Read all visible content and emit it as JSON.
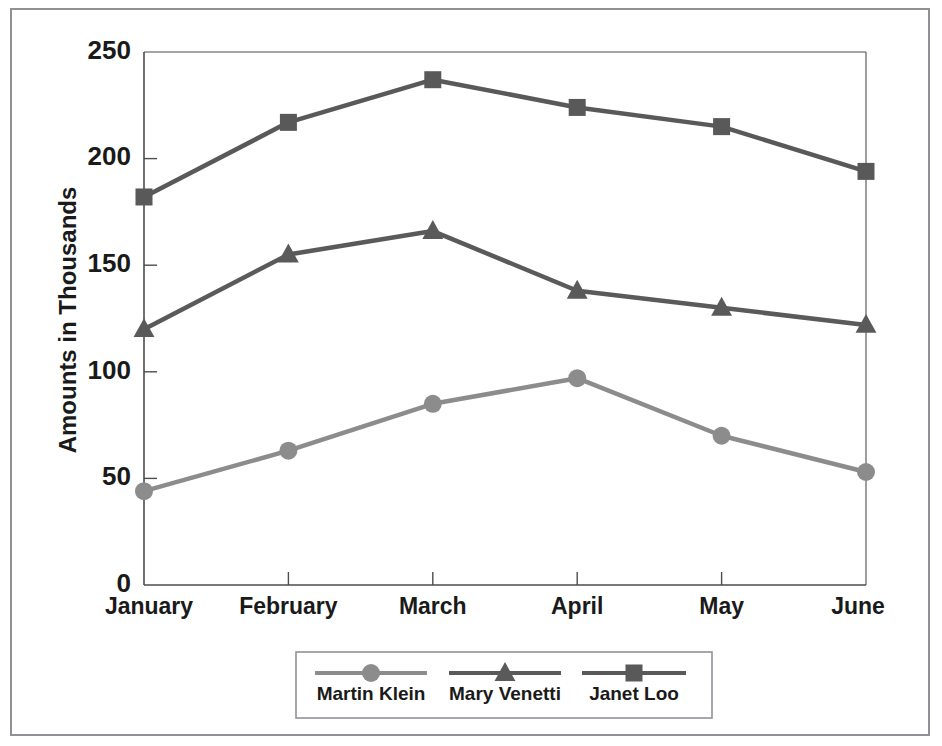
{
  "chart_data": {
    "type": "line",
    "title": "",
    "xlabel": "",
    "ylabel": "Amounts in Thousands",
    "categories": [
      "January",
      "February",
      "March",
      "April",
      "May",
      "June"
    ],
    "ylim": [
      0,
      250
    ],
    "yticks": [
      0,
      50,
      100,
      150,
      200,
      250
    ],
    "ytick_labels": [
      "0",
      "50",
      "100",
      "150",
      "200",
      "250"
    ],
    "grid": false,
    "legend_position": "bottom",
    "series": [
      {
        "name": "Martin Klein",
        "marker": "circle",
        "color": "#8c8c8c",
        "values": [
          44,
          63,
          85,
          97,
          70,
          53
        ]
      },
      {
        "name": "Mary Venetti",
        "marker": "triangle",
        "color": "#5a5a5a",
        "values": [
          120,
          155,
          166,
          138,
          130,
          122
        ]
      },
      {
        "name": "Janet Loo",
        "marker": "square",
        "color": "#595959",
        "values": [
          182,
          217,
          237,
          224,
          215,
          194
        ]
      }
    ]
  },
  "legend": {
    "items": [
      {
        "label": "Martin Klein",
        "marker": "circle-marker-icon",
        "color": "#8c8c8c"
      },
      {
        "label": "Mary Venetti",
        "marker": "triangle-marker-icon",
        "color": "#5a5a5a"
      },
      {
        "label": "Janet Loo",
        "marker": "square-marker-icon",
        "color": "#595959"
      }
    ]
  },
  "colors": {
    "frame": "#8e9296",
    "axis": "#4d4d4d",
    "text": "#1a1a1a",
    "background": "#ffffff"
  }
}
